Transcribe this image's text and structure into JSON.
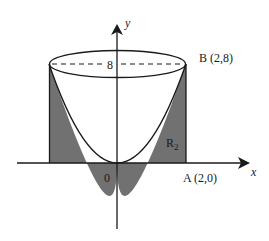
{
  "diagram": {
    "type": "solid-of-revolution",
    "axes": {
      "x_label": "x",
      "y_label": "y",
      "origin_label": "0"
    },
    "labels": {
      "height_mark": "8",
      "point_b": "B (2,8)",
      "point_a": "A (2,0)",
      "region": "R",
      "region_subscript": "2"
    },
    "colors": {
      "shade": "#717171",
      "line": "#1a1a1a",
      "background": "#ffffff"
    }
  }
}
